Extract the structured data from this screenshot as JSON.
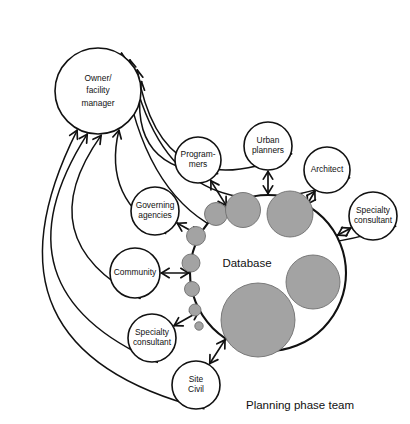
{
  "diagram": {
    "title": "Planning phase team",
    "caption": {
      "text": "Planning phase team",
      "x": 300,
      "y": 406
    },
    "colors": {
      "stroke": "#111111",
      "node_fill": "#ffffff",
      "blob_fill": "#a3a3a3",
      "blob_stroke": "#6f6f6f",
      "background": "#ffffff"
    },
    "hub": {
      "name": "database",
      "label": "Database",
      "label_x": 247,
      "label_y": 264,
      "cx": 268,
      "cy": 273,
      "r": 78
    },
    "blobs": [
      {
        "name": "blob-1",
        "cx": 216,
        "cy": 214,
        "r": 11.5
      },
      {
        "name": "blob-2",
        "cx": 243,
        "cy": 210,
        "r": 17.5
      },
      {
        "name": "blob-3",
        "cx": 290,
        "cy": 214,
        "r": 23
      },
      {
        "name": "blob-4",
        "cx": 196,
        "cy": 236,
        "r": 9.5
      },
      {
        "name": "blob-5",
        "cx": 191,
        "cy": 263,
        "r": 9
      },
      {
        "name": "blob-6",
        "cx": 192,
        "cy": 289,
        "r": 7.5
      },
      {
        "name": "blob-7",
        "cx": 195,
        "cy": 310,
        "r": 6
      },
      {
        "name": "blob-8",
        "cx": 199,
        "cy": 326,
        "r": 4.2
      },
      {
        "name": "blob-9",
        "cx": 313,
        "cy": 282,
        "r": 27
      },
      {
        "name": "blob-10",
        "cx": 258,
        "cy": 320,
        "r": 37
      }
    ],
    "owner": {
      "name": "owner-facility-manager",
      "lines": [
        "Owner/",
        "facility",
        "manager"
      ],
      "cx": 98,
      "cy": 91,
      "r": 43
    },
    "nodes": [
      {
        "name": "programmers",
        "lines": [
          "Program-",
          "mers"
        ],
        "cx": 198,
        "cy": 160,
        "r": 23
      },
      {
        "name": "urban-planners",
        "lines": [
          "Urban",
          "planners"
        ],
        "cx": 268,
        "cy": 146,
        "r": 24
      },
      {
        "name": "architect",
        "lines": [
          "Architect"
        ],
        "cx": 327,
        "cy": 170,
        "r": 23
      },
      {
        "name": "specialty-consultant-right",
        "lines": [
          "Specialty",
          "consultant"
        ],
        "cx": 373,
        "cy": 216,
        "r": 24
      },
      {
        "name": "governing-agencies",
        "lines": [
          "Governing",
          "agencies"
        ],
        "cx": 155,
        "cy": 211,
        "r": 24
      },
      {
        "name": "community",
        "lines": [
          "Community"
        ],
        "cx": 135,
        "cy": 273,
        "r": 25
      },
      {
        "name": "specialty-consultant-left",
        "lines": [
          "Specialty",
          "consultant"
        ],
        "cx": 152,
        "cy": 338,
        "r": 24
      },
      {
        "name": "site-civil",
        "lines": [
          "Site",
          "Civil"
        ],
        "cx": 196,
        "cy": 385,
        "r": 24
      }
    ],
    "spoke_links": [
      {
        "name": "link-programmers-database",
        "from": "programmers",
        "to": "database"
      },
      {
        "name": "link-urban-planners-database",
        "from": "urban-planners",
        "to": "database"
      },
      {
        "name": "link-architect-database",
        "from": "architect",
        "to": "database"
      },
      {
        "name": "link-specialty-right-database",
        "from": "specialty-consultant-right",
        "to": "database"
      },
      {
        "name": "link-governing-agencies-database",
        "from": "governing-agencies",
        "to": "database"
      },
      {
        "name": "link-community-database",
        "from": "community",
        "to": "database"
      },
      {
        "name": "link-specialty-left-database",
        "from": "specialty-consultant-left",
        "to": "database"
      },
      {
        "name": "link-site-civil-database",
        "from": "site-civil",
        "to": "database"
      }
    ],
    "owner_links": [
      {
        "name": "link-specialty-right-owner",
        "from": "specialty-consultant-right",
        "to": "owner-facility-manager"
      },
      {
        "name": "link-architect-owner",
        "from": "architect",
        "to": "owner-facility-manager"
      },
      {
        "name": "link-urban-planners-owner",
        "from": "urban-planners",
        "to": "owner-facility-manager"
      },
      {
        "name": "link-programmers-owner",
        "from": "programmers",
        "to": "owner-facility-manager"
      },
      {
        "name": "link-governing-agencies-owner",
        "from": "governing-agencies",
        "to": "owner-facility-manager"
      },
      {
        "name": "link-community-owner",
        "from": "community",
        "to": "owner-facility-manager"
      },
      {
        "name": "link-specialty-left-owner",
        "from": "specialty-consultant-left",
        "to": "owner-facility-manager"
      },
      {
        "name": "link-site-civil-owner",
        "from": "site-civil",
        "to": "owner-facility-manager"
      }
    ]
  }
}
